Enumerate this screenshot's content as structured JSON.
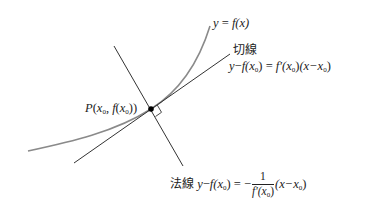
{
  "diagram": {
    "colors": {
      "curve": "#8a8a8a",
      "lines": "#333333",
      "point": "#000000",
      "text": "#222222"
    },
    "curve": {
      "label": "y = f(x)",
      "y": "y",
      "eq": "=",
      "f": "f",
      "arg": "(x)"
    },
    "point": {
      "label": "P(x0, f(x0))",
      "P": "P",
      "open": "(",
      "x": "x",
      "sub": "0",
      "comma": ", ",
      "f": "f",
      "open2": "(",
      "x2": "x",
      "sub2": "0",
      "close": "))"
    },
    "tangent": {
      "name": "切線",
      "equation": "y − f(x0) = f′(x0)(x − x0)",
      "parts": {
        "lhs_y": "y",
        "minus": "−",
        "f": "f",
        "px_open": "(x",
        "sub": "0",
        "px_close": ")",
        "eq": " = ",
        "fprime": "f′",
        "arg_open": "(x",
        "arg_sub": "0",
        "arg_close": ")",
        "paren": "(x−x",
        "paren_sub": "0",
        "paren_close": ")"
      }
    },
    "normal": {
      "name": "法線",
      "equation": "y − f(x0) = −(1 / f′(x0))(x − x0)",
      "parts": {
        "lhs_y": "y",
        "minus": "−",
        "f": "f",
        "px_open": "(x",
        "sub": "0",
        "px_close": ")",
        "eq": " = −",
        "num": "1",
        "den_f": "f′",
        "den_open": "(x",
        "den_sub": "0",
        "den_close": ")",
        "paren": "(x−x",
        "paren_sub": "0",
        "paren_close": ")"
      }
    },
    "right_angle_marker": true
  }
}
